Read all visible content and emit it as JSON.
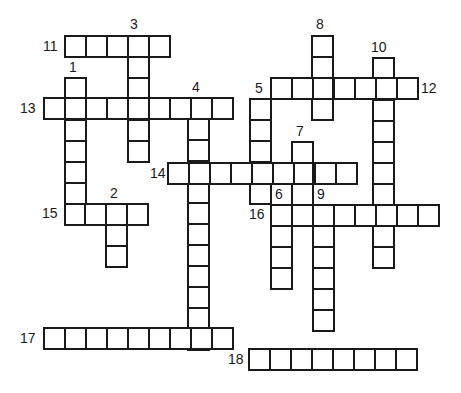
{
  "puzzle": {
    "type": "crossword",
    "cell_size": 21,
    "line_color": "#1a1a1a",
    "background": "#ffffff",
    "words": [
      {
        "number": "1",
        "direction": "down",
        "x": 64,
        "y": 77,
        "length": 7
      },
      {
        "number": "2",
        "direction": "down",
        "x": 105,
        "y": 203,
        "length": 3
      },
      {
        "number": "3",
        "direction": "down",
        "x": 127,
        "y": 35,
        "length": 6
      },
      {
        "number": "4",
        "direction": "down",
        "x": 187,
        "y": 97,
        "length": 12
      },
      {
        "number": "5",
        "direction": "down",
        "x": 249,
        "y": 98,
        "length": 5
      },
      {
        "number": "6",
        "direction": "down",
        "x": 270,
        "y": 204,
        "length": 4
      },
      {
        "number": "7",
        "direction": "down",
        "x": 291,
        "y": 141,
        "length": 4
      },
      {
        "number": "8",
        "direction": "down",
        "x": 311,
        "y": 35,
        "length": 4
      },
      {
        "number": "9",
        "direction": "down",
        "x": 312,
        "y": 204,
        "length": 6
      },
      {
        "number": "10",
        "direction": "down",
        "x": 372,
        "y": 57,
        "length": 10
      },
      {
        "number": "11",
        "direction": "across",
        "x": 64,
        "y": 35,
        "length": 5
      },
      {
        "number": "12",
        "direction": "across",
        "x": 270,
        "y": 77,
        "length": 7
      },
      {
        "number": "13",
        "direction": "across",
        "x": 43,
        "y": 97,
        "length": 9
      },
      {
        "number": "14",
        "direction": "across",
        "x": 167,
        "y": 162,
        "length": 9
      },
      {
        "number": "15",
        "direction": "across",
        "x": 63,
        "y": 203,
        "length": 4
      },
      {
        "number": "16",
        "direction": "across",
        "x": 270,
        "y": 204,
        "length": 8
      },
      {
        "number": "17",
        "direction": "across",
        "x": 43,
        "y": 327,
        "length": 9
      },
      {
        "number": "18",
        "direction": "across",
        "x": 248,
        "y": 348,
        "length": 8
      }
    ],
    "labels": [
      {
        "text": "3",
        "x": 130,
        "y": 17
      },
      {
        "text": "11",
        "x": 43,
        "y": 39
      },
      {
        "text": "8",
        "x": 316,
        "y": 17
      },
      {
        "text": "10",
        "x": 371,
        "y": 40
      },
      {
        "text": "1",
        "x": 69,
        "y": 60
      },
      {
        "text": "4",
        "x": 192,
        "y": 80
      },
      {
        "text": "5",
        "x": 255,
        "y": 81
      },
      {
        "text": "12",
        "x": 421,
        "y": 81
      },
      {
        "text": "13",
        "x": 20,
        "y": 101
      },
      {
        "text": "7",
        "x": 296,
        "y": 124
      },
      {
        "text": "14",
        "x": 150,
        "y": 166
      },
      {
        "text": "2",
        "x": 110,
        "y": 186
      },
      {
        "text": "6",
        "x": 275,
        "y": 187
      },
      {
        "text": "9",
        "x": 317,
        "y": 187
      },
      {
        "text": "15",
        "x": 42,
        "y": 206
      },
      {
        "text": "16",
        "x": 249,
        "y": 207
      },
      {
        "text": "17",
        "x": 20,
        "y": 331
      },
      {
        "text": "18",
        "x": 228,
        "y": 352
      }
    ]
  }
}
